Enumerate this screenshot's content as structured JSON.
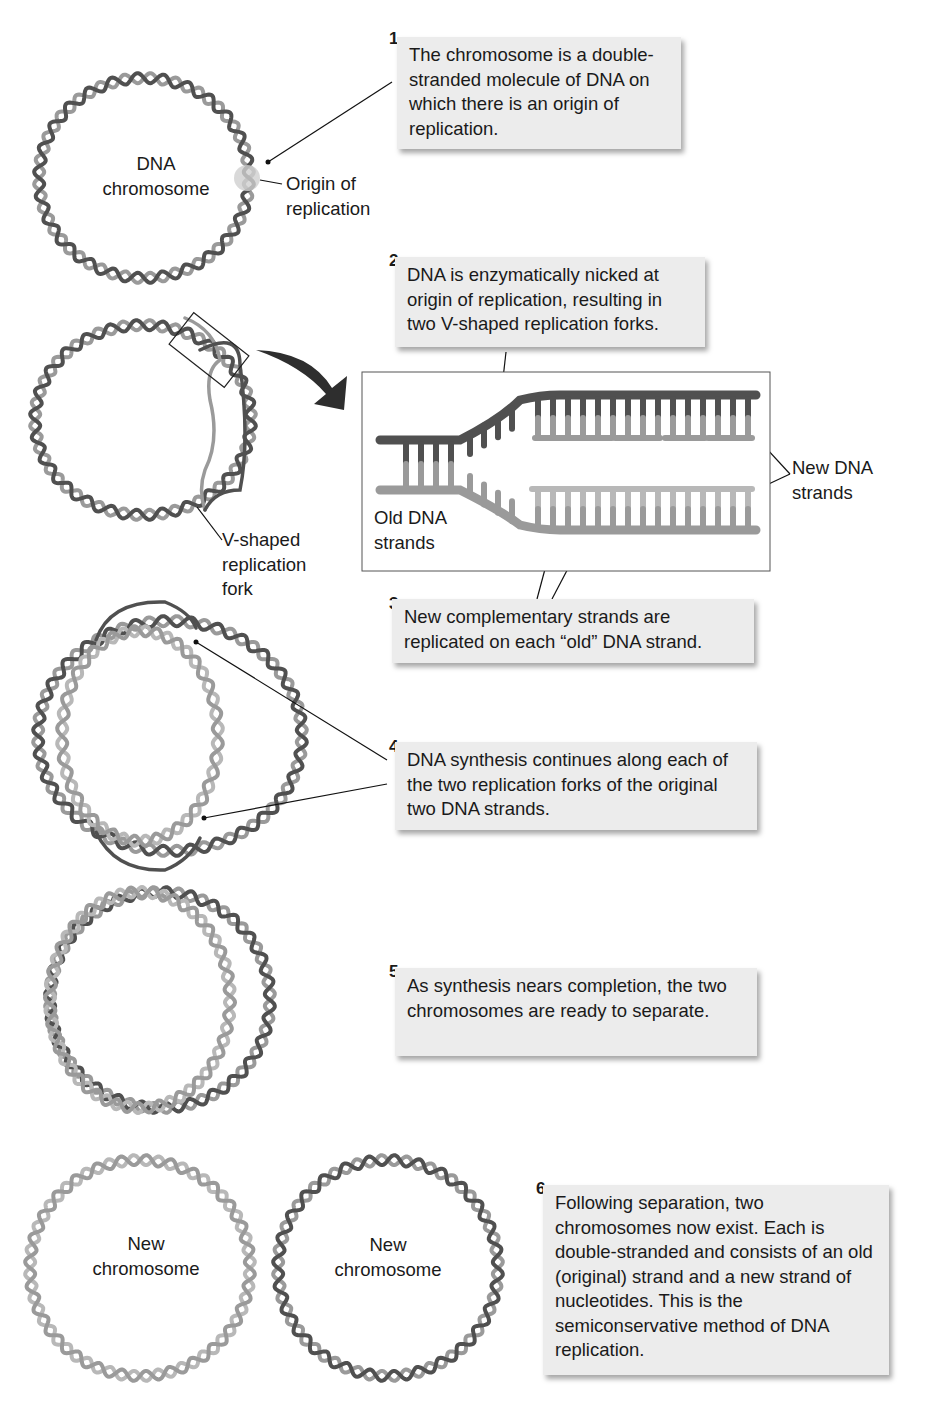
{
  "steps": [
    {
      "number": "1",
      "text": "The chromosome is a double-stranded molecule of DNA on which there is an origin of replication."
    },
    {
      "number": "2",
      "text": "DNA is enzymatically nicked at origin of replication, resulting in two V-shaped replication forks."
    },
    {
      "number": "3",
      "text": "New complementary strands are replicated on each “old” DNA strand."
    },
    {
      "number": "4",
      "text": "DNA synthesis continues along each of the two replication forks of the original two DNA strands."
    },
    {
      "number": "5",
      "text": "As synthesis nears completion, the two chromosomes are ready to separate."
    },
    {
      "number": "6",
      "text": "Following separation, two chromosomes now exist. Each is double-stranded and consists of an old (original) strand and a new strand of nucleotides. This is the semiconservative method of DNA replication."
    }
  ],
  "labels": {
    "dna_chromosome_1": "DNA",
    "dna_chromosome_2": "chromosome",
    "origin_1": "Origin of",
    "origin_2": "replication",
    "fork_1": "V-shaped",
    "fork_2": "replication",
    "fork_3": "fork",
    "old_strands_1": "Old DNA",
    "old_strands_2": "strands",
    "new_strands_1": "New DNA",
    "new_strands_2": "strands",
    "new_chromosome_a_1": "New",
    "new_chromosome_a_2": "chromosome",
    "new_chromosome_b_1": "New",
    "new_chromosome_b_2": "chromosome"
  },
  "colors": {
    "old_strand": "#505050",
    "new_strand": "#9a9a9a",
    "light_strand": "#b8b8b8",
    "box_fill": "#ececec"
  }
}
